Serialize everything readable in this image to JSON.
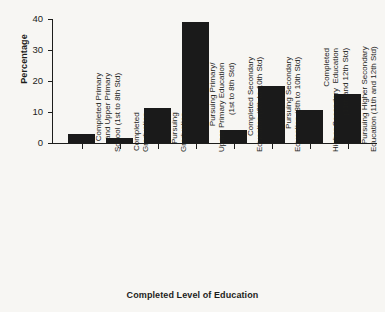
{
  "chart_data": {
    "type": "bar",
    "title": "",
    "xlabel": "Completed Level of Education",
    "ylabel": "Percentage",
    "ylim": [
      0,
      40
    ],
    "yticks": [
      0,
      10,
      20,
      30,
      40
    ],
    "grid": false,
    "legend": null,
    "categories": [
      "Completed Primary\nand Upper Primary\nSchool (1st to 8th Std)",
      "Completed\nGraduation",
      "Pursuing\nGraduation",
      "Pursuing Primary/\nUpper Primary Education\n(1st to 8th Std)",
      "Completed Secondary\nEducation (8th to 10th Std)",
      "Pursuing Secondary\nEducation (8th to 10th Std)",
      "Completed\nHigher Secondary  Education\n(11th and 12th Std)",
      "Pursuing Higher Secondary\nEducation (11th and 12th Std)"
    ],
    "values": [
      2.9,
      1.6,
      11.3,
      39.0,
      4.2,
      18.3,
      10.5,
      15.9
    ]
  },
  "axis": {
    "y_title": "Percentage",
    "x_title": "Completed Level of Education",
    "y_tick_labels": [
      "40",
      "30",
      "20",
      "10",
      "0"
    ]
  }
}
